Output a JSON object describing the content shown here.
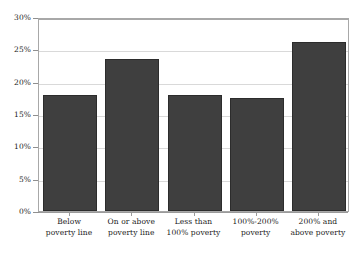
{
  "chart_data": {
    "type": "bar",
    "title": "",
    "subtitle": "",
    "xlabel": "",
    "ylabel": "",
    "categories": [
      "Below poverty line",
      "On or above poverty line",
      "Less than 100% poverty",
      "100%-200% poverty",
      "200% and above poverty"
    ],
    "category_lines": [
      [
        "Below",
        "poverty line"
      ],
      [
        "On or above",
        "poverty line"
      ],
      [
        "Less than",
        "100% poverty"
      ],
      [
        "100%-200%",
        "poverty"
      ],
      [
        "200% and",
        "above poverty"
      ]
    ],
    "values": [
      17.9,
      23.5,
      18.0,
      17.4,
      26.1
    ],
    "value_labels": [
      "",
      "",
      "",
      "",
      ""
    ],
    "ylim": [
      0,
      30
    ],
    "y_ticks": [
      0,
      5,
      10,
      15,
      20,
      25,
      30
    ],
    "y_tick_labels": [
      "0%",
      "5%",
      "10%",
      "15%",
      "20%",
      "25%",
      "30%"
    ],
    "grid": true,
    "legend": false,
    "legend_position": "none",
    "bar_color": "#3f3f3f",
    "bar_border_color": "#2c2c2c",
    "grid_color": "#d9d9d9",
    "axis_color": "#8f8f8f",
    "background_color": "#ffffff",
    "text_color": "#1a1a1a"
  }
}
